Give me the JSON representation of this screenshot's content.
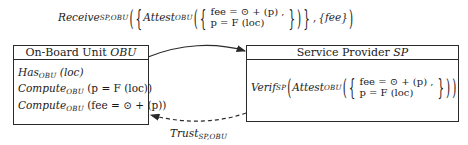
{
  "diagram": {
    "type": "protocol-interaction",
    "top_message": {
      "function": "Receive",
      "function_subscript": "SP,OBU",
      "inner_function": "Attest",
      "inner_subscript": "OBU",
      "set_items": [
        "fee = ⊙ + (p) ,",
        "p = F (loc)"
      ],
      "extra_set": "{fee}"
    },
    "obu_box": {
      "title_prefix": "On-Board Unit ",
      "title_var": "OBU",
      "lines": [
        {
          "fn": "Has",
          "sub": "OBU",
          "arg": "(loc)"
        },
        {
          "fn": "Compute",
          "sub": "OBU",
          "arg": "(p = F (loc))"
        },
        {
          "fn": "Compute",
          "sub": "OBU",
          "arg": "(fee = ⊙ + (p))"
        }
      ]
    },
    "sp_box": {
      "title_prefix": "Service Provider ",
      "title_var": "SP",
      "verify": {
        "fn": "Verif",
        "sub": "SP",
        "inner_fn": "Attest",
        "inner_sub": "OBU",
        "set_items": [
          "fee = ⊙ + (p) ,",
          "p = F (loc)"
        ]
      }
    },
    "bottom_message": {
      "function": "Trust",
      "function_subscript": "SP,OBU"
    },
    "edges": [
      {
        "from": "obu_box",
        "to": "sp_box",
        "style": "solid",
        "label": "top_message"
      },
      {
        "from": "sp_box",
        "to": "obu_box",
        "style": "dashed",
        "label": "bottom_message"
      }
    ],
    "colors": {
      "stroke": "#2a2a2a",
      "text": "#1a1a1a",
      "background": "#ffffff"
    }
  }
}
